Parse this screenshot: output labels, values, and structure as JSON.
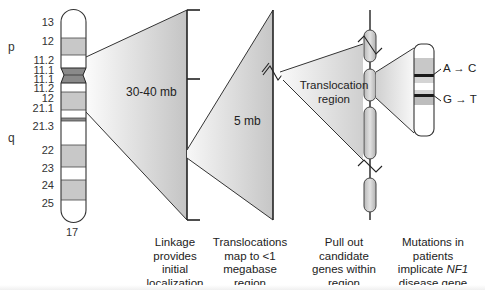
{
  "chromosome": {
    "number": "17",
    "arms": {
      "p": "p",
      "q": "q"
    },
    "bands": [
      {
        "label": "13",
        "y": 22
      },
      {
        "label": "12",
        "y": 41
      },
      {
        "label": "11.2",
        "y": 60
      },
      {
        "label": "11.1",
        "y": 70
      },
      {
        "label": "11.1",
        "y": 79
      },
      {
        "label": "11.2",
        "y": 88
      },
      {
        "label": "12",
        "y": 98
      },
      {
        "label": "21.1",
        "y": 108
      },
      {
        "label": "21.3",
        "y": 126
      },
      {
        "label": "22",
        "y": 150
      },
      {
        "label": "23",
        "y": 168
      },
      {
        "label": "24",
        "y": 185
      },
      {
        "label": "25",
        "y": 203
      }
    ]
  },
  "stages": {
    "linkage": {
      "size_label": "30-40 mb",
      "caption": [
        "Linkage",
        "provides",
        "initial",
        "localization"
      ]
    },
    "translocation": {
      "size_label": "5 mb",
      "caption": [
        "Translocations",
        "map to <1",
        "megabase",
        "region"
      ]
    },
    "candidates": {
      "region_label": [
        "Translocation",
        "region"
      ],
      "caption": [
        "Pull out",
        "candidate",
        "genes within",
        "region"
      ]
    },
    "mutations": {
      "mutation_1": "A → C",
      "mutation_2": "G → T",
      "caption": [
        "Mutations in",
        "patients",
        "implicate",
        "NF1",
        "disease gene"
      ]
    }
  },
  "colors": {
    "stroke": "#333333",
    "band_gray": "#c8c8c8",
    "centromere": "#8a8a8a",
    "wedge_light": "#f4f4f4",
    "wedge_dark": "#c9c9c9"
  }
}
